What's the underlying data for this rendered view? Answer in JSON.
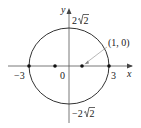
{
  "diagram": {
    "type": "ellipse",
    "axes": {
      "x_label": "x",
      "y_label": "y"
    },
    "labels": {
      "left_intercept": "−3",
      "right_intercept": "3",
      "origin": "0",
      "top_intercept_coef": "2",
      "top_intercept_rad": "2",
      "bottom_intercept_coef": "−2",
      "bottom_intercept_rad": "2",
      "focus_label": "(1, 0)"
    },
    "points": [
      {
        "name": "left-vertex",
        "x": -3,
        "y": 0
      },
      {
        "name": "left-focus",
        "x": -1,
        "y": 0
      },
      {
        "name": "right-focus",
        "x": 1,
        "y": 0
      },
      {
        "name": "right-vertex",
        "x": 3,
        "y": 0
      }
    ],
    "colors": {
      "stroke": "#333333",
      "axis": "#555555",
      "arrow": "#888888"
    }
  }
}
